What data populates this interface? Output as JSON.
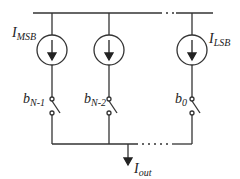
{
  "diagram": {
    "type": "current-steering DAC",
    "colors": {
      "stroke": "#333333",
      "background": "#ffffff"
    },
    "current_sources": [
      {
        "main": "I",
        "sub": "MSB"
      },
      {
        "main": "",
        "sub": ""
      },
      {
        "main": "I",
        "sub": "LSB"
      }
    ],
    "switches": [
      {
        "main": "b",
        "sub": "N-1"
      },
      {
        "main": "b",
        "sub": "N-2"
      },
      {
        "main": "b",
        "sub": "0"
      }
    ],
    "output": {
      "main": "I",
      "sub": "out"
    }
  }
}
